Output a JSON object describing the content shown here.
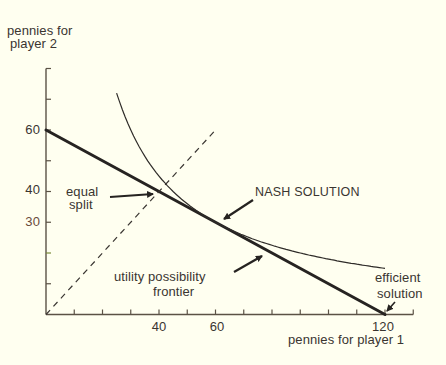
{
  "chart_data": {
    "type": "line",
    "title": "",
    "xlabel": "pennies for player 1",
    "ylabel": "pennies for player 2",
    "xlim": [
      0,
      130
    ],
    "ylim": [
      0,
      80
    ],
    "grid": false,
    "legend": null,
    "x_ticks": [
      10,
      20,
      30,
      40,
      50,
      60,
      70,
      80,
      90,
      100,
      110,
      120,
      130
    ],
    "y_ticks": [
      10,
      20,
      30,
      40,
      50,
      60,
      70,
      80
    ],
    "x_tick_labels": {
      "40": "40",
      "60": "60",
      "120": "120"
    },
    "y_tick_labels": {
      "60": "60",
      "40": "40",
      "30": "30"
    },
    "series": [
      {
        "name": "utility possibility frontier",
        "style": "thick solid",
        "x": [
          0,
          120
        ],
        "y": [
          60,
          0
        ]
      },
      {
        "name": "equal split line",
        "style": "dashed",
        "x": [
          0,
          60
        ],
        "y": [
          0,
          60
        ]
      },
      {
        "name": "Nash product curve (x*y = 1800)",
        "style": "thin solid",
        "x": [
          25,
          30,
          40,
          50,
          60,
          70,
          80,
          90,
          100,
          110,
          120
        ],
        "y": [
          72,
          60,
          45,
          36,
          30,
          25.7,
          22.5,
          20,
          18,
          16.4,
          15
        ]
      }
    ],
    "annotations": [
      {
        "id": "equal_split",
        "lines": [
          "equal",
          "split"
        ],
        "target": [
          40,
          40
        ]
      },
      {
        "id": "nash",
        "lines": [
          "NASH SOLUTION"
        ],
        "target": [
          60,
          30
        ]
      },
      {
        "id": "frontier",
        "lines": [
          "utility possibility",
          "frontier"
        ],
        "target": [
          76,
          22
        ]
      },
      {
        "id": "efficient",
        "lines": [
          "efficient",
          "solution"
        ],
        "target": [
          120,
          0
        ]
      }
    ],
    "key_points": {
      "equal_split": [
        40,
        40
      ],
      "nash_solution": [
        60,
        30
      ],
      "efficient_solution": [
        120,
        0
      ]
    }
  },
  "labels": {
    "y_axis_title_line1": "pennies for",
    "y_axis_title_line2": "player 2",
    "x_axis_title": "pennies for player 1",
    "y_tick_60": "60",
    "y_tick_40": "40",
    "y_tick_30": "30",
    "x_tick_40": "40",
    "x_tick_60": "60",
    "x_tick_120": "120",
    "equal_line1": "equal",
    "equal_line2": "split",
    "nash": "NASH SOLUTION",
    "frontier_line1": "utility possibility",
    "frontier_line2": "frontier",
    "efficient_line1": "efficient",
    "efficient_line2": "solution"
  },
  "colors": {
    "background": "#fffff0",
    "axis": "#5b5245",
    "frontier": "#262321",
    "curve": "#2f2c29",
    "dashed": "#3a3632",
    "text": "#3a3530"
  }
}
